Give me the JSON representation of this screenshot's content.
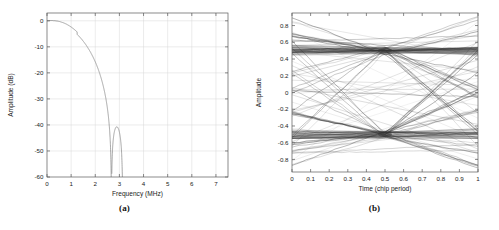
{
  "figure": {
    "background_color": "#ffffff",
    "axis_color": "#5a5a5a",
    "grid_color": "#d8d8d8",
    "trace_color": "#777777",
    "eye_color": "#333333",
    "panels": [
      {
        "id": "a",
        "caption": "(a)"
      },
      {
        "id": "b",
        "caption": "(b)"
      }
    ]
  },
  "chart_data": [
    {
      "type": "line",
      "panel": "a",
      "title": "",
      "xlabel": "Frequency (MHz)",
      "ylabel": "Amplitude (dB)",
      "xlim": [
        0,
        7.5
      ],
      "ylim": [
        -60,
        3
      ],
      "xticks": [
        0,
        1,
        2,
        3,
        4,
        5,
        6,
        7
      ],
      "xticklabels": [
        "0",
        "1",
        "2",
        "3",
        "4",
        "5",
        "6",
        "7"
      ],
      "yticks": [
        0,
        -10,
        -20,
        -30,
        -40,
        -50,
        -60
      ],
      "yticklabels": [
        "0",
        "-10",
        "-20",
        "-30",
        "-40",
        "-50",
        "-60"
      ],
      "grid": true,
      "legend": "none",
      "description": "Spectrum magnitude response of a pulse-shaped chip waveform: flat main lobe near 0 dB up to about 1.2 MHz, roll-off to a first null near 2.67 MHz, followed by decaying sidelobes.",
      "nulls_mhz": [
        2.67,
        3.56,
        4.45,
        5.34,
        6.23,
        7.12
      ],
      "sidelobe_peaks": [
        {
          "x": 3.0,
          "y": -22.0
        },
        {
          "x": 3.95,
          "y": -26.5
        },
        {
          "x": 4.85,
          "y": -29.2
        },
        {
          "x": 5.75,
          "y": -30.8
        },
        {
          "x": 6.65,
          "y": -32.0
        },
        {
          "x": 7.45,
          "y": -31.5
        }
      ],
      "main_lobe": [
        {
          "x": 0.0,
          "y": 0.0
        },
        {
          "x": 0.3,
          "y": 0.3
        },
        {
          "x": 0.6,
          "y": 0.6
        },
        {
          "x": 0.9,
          "y": 0.85
        },
        {
          "x": 1.1,
          "y": 0.9
        },
        {
          "x": 1.3,
          "y": 0.6
        },
        {
          "x": 1.5,
          "y": -0.2
        },
        {
          "x": 1.7,
          "y": -1.6
        },
        {
          "x": 1.9,
          "y": -3.6
        },
        {
          "x": 2.1,
          "y": -6.5
        },
        {
          "x": 2.3,
          "y": -11.0
        },
        {
          "x": 2.45,
          "y": -16.0
        },
        {
          "x": 2.58,
          "y": -24.0
        },
        {
          "x": 2.67,
          "y": -60.0
        }
      ]
    },
    {
      "type": "line",
      "panel": "b",
      "title": "",
      "xlabel": "Time (chip period)",
      "ylabel": "Amplitude",
      "xlim": [
        0,
        1
      ],
      "ylim": [
        -0.95,
        0.95
      ],
      "xticks": [
        0,
        0.1,
        0.2,
        0.3,
        0.4,
        0.5,
        0.6,
        0.7,
        0.8,
        0.9,
        1
      ],
      "xticklabels": [
        "0",
        "0.1",
        "0.2",
        "0.3",
        "0.4",
        "0.5",
        "0.6",
        "0.7",
        "0.8",
        "0.9",
        "1"
      ],
      "yticks": [
        0.8,
        0.6,
        0.4,
        0.2,
        0,
        -0.2,
        -0.4,
        -0.6,
        -0.8
      ],
      "yticklabels": [
        "0.8",
        "0.6",
        "0.4",
        "0.2",
        "0",
        "-0.2",
        "-0.4",
        "-0.6",
        "-0.8"
      ],
      "grid": false,
      "legend": "none",
      "description": "Eye diagram over one chip period showing many overlaid traces; dense crossing clusters near amplitude +0.5 and -0.5 at time 0.5, with an open eye between them.",
      "crossing_points": [
        {
          "x": 0.5,
          "y": 0.5
        },
        {
          "x": 0.5,
          "y": -0.5
        }
      ],
      "eye_levels": [
        0.85,
        0.62,
        0.5,
        0.25,
        0.05,
        -0.05,
        -0.25,
        -0.5,
        -0.62,
        -0.85
      ],
      "trace_count": 64
    }
  ]
}
